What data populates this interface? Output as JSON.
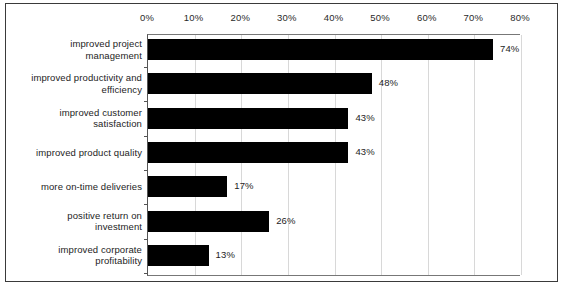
{
  "chart_data": {
    "type": "bar",
    "orientation": "horizontal",
    "title": "",
    "subtitle": "",
    "xlabel": "",
    "ylabel": "",
    "xlim": [
      0,
      80
    ],
    "grid": true,
    "legend": null,
    "bar_color": "#000000",
    "categories": [
      "improved project management",
      "improved productivity and efficiency",
      "improved customer satisfaction",
      "improved product quality",
      "more on-time deliveries",
      "positive return on investment",
      "improved corporate profitability"
    ],
    "category_lines": [
      [
        "improved project",
        "management"
      ],
      [
        "improved productivity and",
        "efficiency"
      ],
      [
        "improved customer",
        "satisfaction"
      ],
      [
        "improved product quality"
      ],
      [
        "more on-time deliveries"
      ],
      [
        "positive return on",
        "investment"
      ],
      [
        "improved corporate",
        "profitability"
      ]
    ],
    "values": [
      74,
      48,
      43,
      43,
      17,
      26,
      13
    ],
    "value_labels": [
      "74%",
      "48%",
      "43%",
      "43%",
      "17%",
      "26%",
      "13%"
    ],
    "x_ticks": [
      0,
      10,
      20,
      30,
      40,
      50,
      60,
      70,
      80
    ],
    "x_tick_labels": [
      "0%",
      "10%",
      "20%",
      "30%",
      "40%",
      "50%",
      "60%",
      "70%",
      "80%"
    ]
  }
}
